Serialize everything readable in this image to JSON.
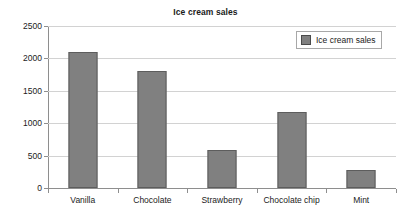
{
  "chart_data": {
    "type": "bar",
    "title": "Ice cream sales",
    "xlabel": "",
    "ylabel": "",
    "categories": [
      "Vanilla",
      "Chocolate",
      "Strawberry",
      "Chocolate chip",
      "Mint"
    ],
    "values": [
      2100,
      1800,
      580,
      1180,
      280
    ],
    "series": [
      {
        "name": "Ice cream sales",
        "values": [
          2100,
          1800,
          580,
          1180,
          280
        ]
      }
    ],
    "ylim": [
      0,
      2500
    ],
    "ytick_labels": [
      "0",
      "500",
      "1000",
      "1500",
      "2000",
      "2500"
    ],
    "ytick_values": [
      0,
      500,
      1000,
      1500,
      2000,
      2500
    ],
    "grid": "horizontal",
    "legend": {
      "position": "top-right",
      "entries": [
        {
          "label": "Ice cream sales",
          "color": "#808080"
        }
      ]
    },
    "colors": {
      "bar_fill": "#808080",
      "bar_edge": "#5d5d5d",
      "gridline": "#d2d2d2",
      "axis": "#8e8e8e",
      "background": "#ffffff",
      "text": "#1b1b1b"
    }
  }
}
